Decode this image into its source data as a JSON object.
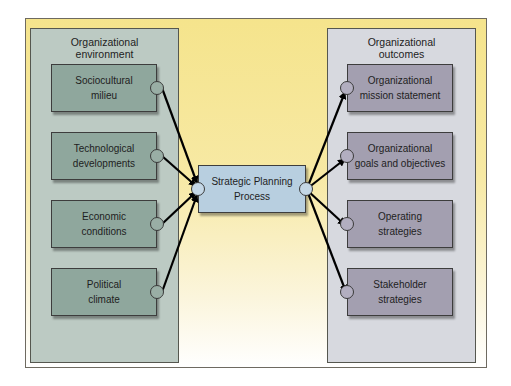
{
  "diagram": {
    "left_panel": {
      "title": "Organizational\nenvironment",
      "boxes": [
        {
          "label": "Sociocultural\nmilieu"
        },
        {
          "label": "Technological\ndevelopments"
        },
        {
          "label": "Economic\nconditions"
        },
        {
          "label": "Political\nclimate"
        }
      ]
    },
    "center": {
      "label": "Strategic Planning\nProcess"
    },
    "right_panel": {
      "title": "Organizational\noutcomes",
      "boxes": [
        {
          "label": "Organizational\nmission statement"
        },
        {
          "label": "Organizational\ngoals and objectives"
        },
        {
          "label": "Operating\nstrategies"
        },
        {
          "label": "Stakeholder\nstrategies"
        }
      ]
    },
    "colors": {
      "background_top": "#f5e48c",
      "left_panel": "#bccac3",
      "left_box": "#8fa79d",
      "right_panel": "#d7d9df",
      "right_box": "#a39fb0",
      "center_box": "#b8cfe0",
      "arrow": "#000000"
    }
  }
}
